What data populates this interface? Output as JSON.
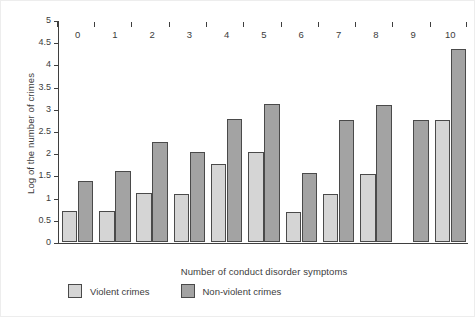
{
  "chart_data": {
    "type": "bar",
    "title": "",
    "xlabel": "Number of conduct disorder symptoms",
    "ylabel": "Log of the number of crimes",
    "categories": [
      "0",
      "1",
      "2",
      "3",
      "4",
      "5",
      "6",
      "7",
      "8",
      "9",
      "10"
    ],
    "series": [
      {
        "name": "Violent crimes",
        "color": "#d5d5d5",
        "values": [
          0.7,
          0.69,
          1.1,
          1.08,
          1.76,
          2.02,
          0.67,
          1.08,
          1.53,
          null,
          2.74
        ]
      },
      {
        "name": "Non-violent crimes",
        "color": "#a3a3a3",
        "values": [
          1.37,
          1.6,
          2.26,
          2.03,
          2.76,
          3.1,
          1.56,
          2.74,
          3.09,
          2.74,
          4.35
        ]
      }
    ],
    "ylim": [
      0,
      5
    ],
    "yticks": [
      "0",
      "0.5",
      "1",
      "1.5",
      "2",
      "2.5",
      "3",
      "3.5",
      "4",
      "4.5",
      "5"
    ],
    "ytick_values": [
      0,
      0.5,
      1,
      1.5,
      2,
      2.5,
      3,
      3.5,
      4,
      4.5,
      5
    ],
    "grid": false,
    "legend_position": "bottom-left"
  },
  "legend": {
    "items": [
      {
        "label": "Violent crimes",
        "swatch": "violent"
      },
      {
        "label": "Non-violent crimes",
        "swatch": "nonviolent"
      }
    ]
  }
}
